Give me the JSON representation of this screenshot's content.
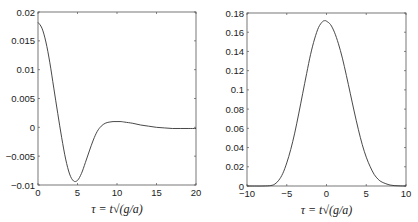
{
  "chart_data": [
    {
      "type": "line",
      "title": "",
      "xlabel": "τ = t√(g/a)",
      "ylabel": "",
      "xlim": [
        0,
        20
      ],
      "ylim": [
        -0.01,
        0.02
      ],
      "xticks": [
        0,
        5,
        10,
        15,
        20
      ],
      "xtick_labels": [
        "0",
        "5",
        "10",
        "15",
        "20"
      ],
      "yticks": [
        -0.01,
        -0.005,
        0,
        0.005,
        0.01,
        0.015,
        0.02
      ],
      "ytick_labels": [
        "-0.01",
        "-0.005",
        "0",
        "0.005",
        "0.01",
        "0.015",
        "0.02"
      ],
      "grid": false,
      "series": [
        {
          "name": "left-curve",
          "x": [
            0,
            0.5,
            1,
            1.5,
            2,
            2.5,
            3,
            3.5,
            4,
            4.5,
            5,
            5.5,
            6,
            6.5,
            7,
            7.5,
            8,
            8.5,
            9,
            9.5,
            10,
            10.5,
            11,
            12,
            13,
            14,
            15,
            16,
            17,
            18,
            19,
            20
          ],
          "y": [
            0.0182,
            0.0172,
            0.0148,
            0.0112,
            0.0068,
            0.0024,
            -0.0018,
            -0.0055,
            -0.0081,
            -0.0093,
            -0.0092,
            -0.008,
            -0.0061,
            -0.0041,
            -0.0022,
            -0.0007,
            0.0002,
            0.0007,
            0.0009,
            0.001,
            0.001,
            0.001,
            0.0009,
            0.0007,
            0.0004,
            0.0002,
            0.0,
            -0.0001,
            -0.0002,
            -0.0002,
            -0.0002,
            -0.0002
          ]
        }
      ]
    },
    {
      "type": "line",
      "title": "",
      "xlabel": "τ = t√(g/a)",
      "ylabel": "",
      "xlim": [
        -10,
        10
      ],
      "ylim": [
        0,
        0.18
      ],
      "xticks": [
        -10,
        -5,
        0,
        5,
        10
      ],
      "xtick_labels": [
        "-10",
        "-5",
        "0",
        "5",
        "10"
      ],
      "yticks": [
        0,
        0.02,
        0.04,
        0.06,
        0.08,
        0.1,
        0.12,
        0.14,
        0.16,
        0.18
      ],
      "ytick_labels": [
        "0",
        "0.02",
        "0.04",
        "0.06",
        "0.08",
        "0.1",
        "0.12",
        "0.14",
        "0.16",
        "0.18"
      ],
      "grid": false,
      "series": [
        {
          "name": "right-curve",
          "x": [
            -10,
            -8,
            -7,
            -6.5,
            -6,
            -5.5,
            -5,
            -4.5,
            -4,
            -3.5,
            -3,
            -2.5,
            -2,
            -1.5,
            -1,
            -0.5,
            -0.2,
            0,
            0.5,
            1,
            1.5,
            2,
            2.5,
            3,
            3.5,
            4,
            4.5,
            5,
            5.5,
            6,
            6.5,
            7,
            8,
            9,
            10
          ],
          "y": [
            0,
            0,
            0.0005,
            0.002,
            0.006,
            0.013,
            0.024,
            0.038,
            0.055,
            0.075,
            0.096,
            0.117,
            0.137,
            0.153,
            0.165,
            0.171,
            0.172,
            0.1715,
            0.168,
            0.16,
            0.148,
            0.133,
            0.115,
            0.096,
            0.077,
            0.059,
            0.043,
            0.03,
            0.02,
            0.012,
            0.007,
            0.004,
            0.001,
            0.0002,
            0
          ]
        }
      ]
    }
  ]
}
